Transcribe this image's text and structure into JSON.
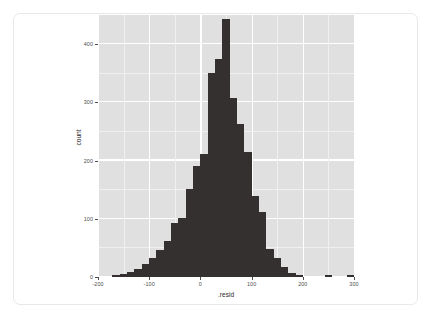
{
  "figure": {
    "panel_background": "#e0e0e0",
    "bar_color": "#33302f",
    "gridline_color": "#ffffff",
    "card_border_color": "#e8e8e8"
  },
  "chart_data": {
    "type": "bar",
    "subtype": "histogram",
    "title": "",
    "xlabel": ".resid",
    "ylabel": "count",
    "xlim": [
      -200,
      300
    ],
    "ylim": [
      0,
      450
    ],
    "grid": true,
    "legend": null,
    "binwidth": 14.3,
    "x_ticks": [
      -200,
      -100,
      0,
      100,
      200,
      300
    ],
    "x_tick_labels": [
      "-200",
      "-100",
      "0",
      "100",
      "200",
      "300"
    ],
    "y_ticks": [
      0,
      100,
      200,
      300,
      400
    ],
    "y_tick_labels": [
      "0",
      "100",
      "200",
      "300",
      "400"
    ],
    "bin_centers": [
      -164,
      -150,
      -136,
      -121,
      -107,
      -93,
      -79,
      -64,
      -50,
      -36,
      -21,
      -7,
      7,
      21,
      36,
      50,
      64,
      79,
      93,
      107,
      121,
      136,
      150,
      179,
      221,
      264
    ],
    "values": [
      3,
      5,
      8,
      13,
      22,
      33,
      46,
      61,
      92,
      101,
      152,
      190,
      211,
      350,
      375,
      443,
      307,
      263,
      215,
      140,
      112,
      48,
      33,
      18,
      7,
      4,
      3,
      4,
      3
    ],
    "bars": [
      {
        "left": -172,
        "right": -157,
        "count": 3
      },
      {
        "left": -157,
        "right": -143,
        "count": 5
      },
      {
        "left": -143,
        "right": -129,
        "count": 9
      },
      {
        "left": -129,
        "right": -114,
        "count": 13
      },
      {
        "left": -114,
        "right": -100,
        "count": 23
      },
      {
        "left": -100,
        "right": -86,
        "count": 33
      },
      {
        "left": -86,
        "right": -72,
        "count": 47
      },
      {
        "left": -72,
        "right": -57,
        "count": 62
      },
      {
        "left": -57,
        "right": -43,
        "count": 93
      },
      {
        "left": -43,
        "right": -29,
        "count": 101
      },
      {
        "left": -29,
        "right": -14,
        "count": 152
      },
      {
        "left": -14,
        "right": 0,
        "count": 190
      },
      {
        "left": 0,
        "right": 14,
        "count": 212
      },
      {
        "left": 14,
        "right": 29,
        "count": 350
      },
      {
        "left": 29,
        "right": 43,
        "count": 375
      },
      {
        "left": 43,
        "right": 57,
        "count": 443
      },
      {
        "left": 57,
        "right": 72,
        "count": 307
      },
      {
        "left": 72,
        "right": 86,
        "count": 263
      },
      {
        "left": 86,
        "right": 100,
        "count": 215
      },
      {
        "left": 100,
        "right": 114,
        "count": 140
      },
      {
        "left": 114,
        "right": 129,
        "count": 112
      },
      {
        "left": 129,
        "right": 143,
        "count": 48
      },
      {
        "left": 143,
        "right": 157,
        "count": 33
      },
      {
        "left": 157,
        "right": 172,
        "count": 18
      },
      {
        "left": 172,
        "right": 186,
        "count": 7
      },
      {
        "left": 186,
        "right": 200,
        "count": 4
      },
      {
        "left": 243,
        "right": 257,
        "count": 4
      },
      {
        "left": 286,
        "right": 300,
        "count": 4
      },
      {
        "left": 372,
        "right": 386,
        "count": 3
      }
    ]
  }
}
